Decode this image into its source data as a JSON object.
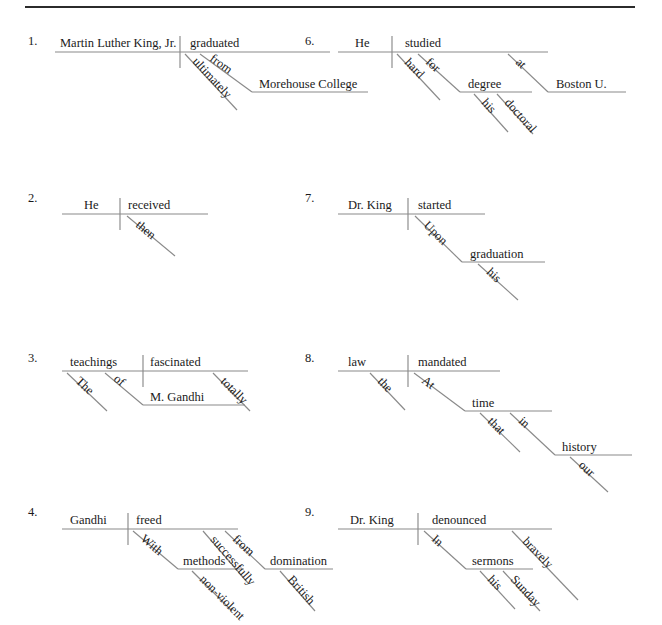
{
  "page": {
    "has_top_rule": true,
    "line_color": "#8a8a8a",
    "text_color": "#1a1a1a",
    "background_color": "#ffffff"
  },
  "diagrams": [
    {
      "number": "1.",
      "sentence": "Martin Luther King, Jr. ultimately graduated from Morehouse College.",
      "subject": "Martin Luther King, Jr.",
      "verb": "graduated",
      "modifiers": [
        "ultimately"
      ],
      "prepositional_phrases": [
        {
          "preposition": "from",
          "object": "Morehouse College"
        }
      ],
      "words": [
        "Martin Luther King, Jr.",
        "graduated",
        "ultimately",
        "from",
        "Morehouse College"
      ]
    },
    {
      "number": "2.",
      "sentence": "He then received.",
      "subject": "He",
      "verb": "received",
      "modifiers": [
        "then"
      ],
      "prepositional_phrases": [],
      "words": [
        "He",
        "received",
        "then"
      ]
    },
    {
      "number": "3.",
      "sentence": "The teachings of M. Gandhi totally fascinated.",
      "subject": "teachings",
      "verb": "fascinated",
      "modifiers": [
        "The",
        "totally"
      ],
      "prepositional_phrases": [
        {
          "preposition": "of",
          "object": "M. Gandhi"
        }
      ],
      "words": [
        "teachings",
        "fascinated",
        "The",
        "of",
        "M. Gandhi",
        "totally"
      ]
    },
    {
      "number": "4.",
      "sentence": "Gandhi successfully freed with non-violent methods from British domination.",
      "subject": "Gandhi",
      "verb": "freed",
      "modifiers": [
        "successfully"
      ],
      "prepositional_phrases": [
        {
          "preposition": "With",
          "object": "methods",
          "object_modifiers": [
            "non-violent"
          ]
        },
        {
          "preposition": "from",
          "object": "domination",
          "object_modifiers": [
            "British"
          ]
        }
      ],
      "words": [
        "Gandhi",
        "freed",
        "With",
        "methods",
        "non-violent",
        "successfully",
        "from",
        "domination",
        "British"
      ]
    },
    {
      "number": "6.",
      "sentence": "He studied hard for his doctoral degree at Boston U.",
      "subject": "He",
      "verb": "studied",
      "modifiers": [
        "hard"
      ],
      "prepositional_phrases": [
        {
          "preposition": "for",
          "object": "degree",
          "object_modifiers": [
            "his",
            "doctoral"
          ]
        },
        {
          "preposition": "at",
          "object": "Boston U."
        }
      ],
      "words": [
        "He",
        "studied",
        "hard",
        "for",
        "degree",
        "his",
        "doctoral",
        "at",
        "Boston U."
      ]
    },
    {
      "number": "7.",
      "sentence": "Dr. King started upon his graduation.",
      "subject": "Dr. King",
      "verb": "started",
      "modifiers": [],
      "prepositional_phrases": [
        {
          "preposition": "Upon",
          "object": "graduation",
          "object_modifiers": [
            "his"
          ]
        }
      ],
      "words": [
        "Dr. King",
        "started",
        "Upon",
        "graduation",
        "his"
      ]
    },
    {
      "number": "8.",
      "sentence": "The law mandated at that time in our history.",
      "subject": "law",
      "verb": "mandated",
      "modifiers": [
        "the"
      ],
      "prepositional_phrases": [
        {
          "preposition": "At",
          "object": "time",
          "object_modifiers": [
            "that"
          ]
        },
        {
          "preposition": "in",
          "object": "history",
          "object_modifiers": [
            "our"
          ]
        }
      ],
      "words": [
        "law",
        "mandated",
        "the",
        "At",
        "time",
        "that",
        "in",
        "history",
        "our"
      ]
    },
    {
      "number": "9.",
      "sentence": "Dr. King bravely denounced in his Sunday sermons.",
      "subject": "Dr. King",
      "verb": "denounced",
      "modifiers": [
        "bravely"
      ],
      "prepositional_phrases": [
        {
          "preposition": "In",
          "object": "sermons",
          "object_modifiers": [
            "his",
            "Sunday"
          ]
        }
      ],
      "words": [
        "Dr. King",
        "denounced",
        "In",
        "sermons",
        "his",
        "Sunday",
        "bravely"
      ]
    }
  ],
  "geometry": {
    "d1": {
      "number_pos": [
        28,
        45
      ],
      "baseline": [
        55,
        52,
        330,
        52
      ],
      "divider": [
        180,
        36,
        180,
        68
      ],
      "subject_text": [
        60,
        47
      ],
      "verb_text": [
        190,
        47
      ],
      "slant_ultimately": [
        185,
        54,
        237,
        110
      ],
      "slant_from": [
        200,
        54,
        252,
        92
      ],
      "obj_baseline": [
        252,
        92,
        368,
        92
      ],
      "ultimately_text": [
        192,
        62
      ],
      "from_text": [
        209,
        60
      ],
      "obj_text": [
        259,
        88
      ]
    },
    "d2": {
      "number_pos": [
        28,
        202
      ],
      "baseline": [
        62,
        214,
        208,
        214
      ],
      "divider": [
        120,
        198,
        120,
        230
      ],
      "subject_text": [
        84,
        209
      ],
      "verb_text": [
        128,
        209
      ],
      "slant_then": [
        127,
        216,
        175,
        256
      ],
      "then_text": [
        135,
        226
      ]
    },
    "d3": {
      "number_pos": [
        28,
        362
      ],
      "baseline": [
        62,
        371,
        248,
        371
      ],
      "divider": [
        143,
        355,
        143,
        387
      ],
      "subject_text": [
        70,
        366
      ],
      "verb_text": [
        150,
        366
      ],
      "slant_the": [
        67,
        373,
        107,
        411
      ],
      "slant_of": [
        105,
        373,
        143,
        405
      ],
      "obj_baseline": [
        143,
        405,
        245,
        405
      ],
      "slant_totally": [
        213,
        373,
        250,
        411
      ],
      "the_text": [
        75,
        382
      ],
      "of_text": [
        113,
        380
      ],
      "obj_text": [
        150,
        401
      ],
      "totally_text": [
        220,
        382
      ]
    },
    "d4": {
      "number_pos": [
        28,
        516
      ],
      "baseline": [
        62,
        529,
        238,
        529
      ],
      "divider": [
        128,
        513,
        128,
        545
      ],
      "subject_text": [
        70,
        524
      ],
      "verb_text": [
        136,
        524
      ],
      "slant_with": [
        133,
        531,
        178,
        569
      ],
      "with_text": [
        140,
        540
      ],
      "obj1_baseline": [
        178,
        569,
        244,
        569
      ],
      "obj1_text": [
        183,
        565
      ],
      "slant_nonviolent": [
        192,
        571,
        232,
        611
      ],
      "nonviolent_text": [
        199,
        580
      ],
      "slant_successfully": [
        203,
        531,
        248,
        583
      ],
      "successfully_text": [
        210,
        540
      ],
      "slant_from": [
        225,
        531,
        265,
        569
      ],
      "from_text": [
        232,
        540
      ],
      "obj2_baseline": [
        265,
        569,
        333,
        569
      ],
      "obj2_text": [
        270,
        565
      ],
      "slant_british": [
        280,
        571,
        315,
        611
      ],
      "british_text": [
        287,
        580
      ]
    },
    "d6": {
      "number_pos": [
        305,
        45
      ],
      "baseline": [
        338,
        52,
        548,
        52
      ],
      "divider": [
        392,
        36,
        392,
        68
      ],
      "subject_text": [
        355,
        47
      ],
      "verb_text": [
        405,
        47
      ],
      "slant_hard": [
        397,
        54,
        440,
        100
      ],
      "hard_text": [
        404,
        63
      ],
      "slant_for": [
        418,
        54,
        460,
        92
      ],
      "for_text": [
        425,
        63
      ],
      "obj1_baseline": [
        460,
        92,
        532,
        92
      ],
      "obj1_text": [
        468,
        88
      ],
      "slant_his": [
        474,
        94,
        508,
        132
      ],
      "his_text": [
        481,
        103
      ],
      "slant_doctoral": [
        497,
        94,
        533,
        134
      ],
      "doctoral_text": [
        504,
        103
      ],
      "slant_at": [
        508,
        54,
        548,
        92
      ],
      "at_text": [
        515,
        63
      ],
      "obj2_baseline": [
        548,
        92,
        626,
        92
      ],
      "obj2_text": [
        556,
        88
      ]
    },
    "d7": {
      "number_pos": [
        305,
        202
      ],
      "baseline": [
        338,
        214,
        485,
        214
      ],
      "divider": [
        408,
        198,
        408,
        230
      ],
      "subject_text": [
        348,
        209
      ],
      "verb_text": [
        418,
        209
      ],
      "slant_upon": [
        415,
        216,
        462,
        262
      ],
      "upon_text": [
        423,
        226
      ],
      "obj_baseline": [
        462,
        262,
        545,
        262
      ],
      "obj_text": [
        470,
        258
      ],
      "slant_his": [
        478,
        264,
        518,
        300
      ],
      "his_text": [
        486,
        273
      ]
    },
    "d8": {
      "number_pos": [
        305,
        362
      ],
      "baseline": [
        338,
        371,
        500,
        371
      ],
      "divider": [
        408,
        355,
        408,
        387
      ],
      "subject_text": [
        348,
        366
      ],
      "verb_text": [
        418,
        366
      ],
      "slant_the": [
        370,
        373,
        405,
        410
      ],
      "the_text": [
        377,
        382
      ],
      "slant_at": [
        414,
        373,
        465,
        411
      ],
      "at_text": [
        421,
        382
      ],
      "obj1_baseline": [
        465,
        411,
        552,
        411
      ],
      "obj1_text": [
        472,
        407
      ],
      "slant_that": [
        480,
        413,
        520,
        452
      ],
      "that_text": [
        487,
        422
      ],
      "slant_in": [
        510,
        413,
        555,
        455
      ],
      "in_text": [
        518,
        422
      ],
      "obj2_baseline": [
        555,
        455,
        632,
        455
      ],
      "obj2_text": [
        562,
        451
      ],
      "slant_our": [
        570,
        457,
        608,
        492
      ],
      "our_text": [
        578,
        466
      ]
    },
    "d9": {
      "number_pos": [
        305,
        516
      ],
      "baseline": [
        338,
        529,
        552,
        529
      ],
      "divider": [
        418,
        513,
        418,
        545
      ],
      "subject_text": [
        350,
        524
      ],
      "verb_text": [
        432,
        524
      ],
      "slant_in": [
        424,
        531,
        466,
        569
      ],
      "in_text": [
        431,
        540
      ],
      "obj_baseline": [
        466,
        569,
        533,
        569
      ],
      "obj_text": [
        472,
        565
      ],
      "slant_his": [
        480,
        571,
        515,
        609
      ],
      "his_text": [
        487,
        580
      ],
      "slant_sunday": [
        503,
        571,
        540,
        611
      ],
      "sunday_text": [
        510,
        580
      ],
      "slant_bravely": [
        512,
        531,
        578,
        600
      ],
      "bravely_text": [
        522,
        542
      ]
    }
  }
}
